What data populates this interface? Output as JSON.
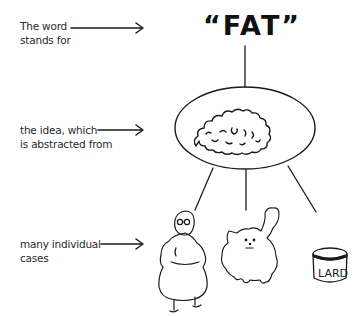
{
  "diagram": {
    "word": "“FAT”",
    "labels": [
      {
        "line1": "The word",
        "line2": "stands for"
      },
      {
        "line1": "the idea, which",
        "line2": "is abstracted from"
      },
      {
        "line1": "many individual",
        "line2": "cases"
      }
    ],
    "idea_illustration": "brain-cloud",
    "cases": [
      {
        "name": "fat-woman"
      },
      {
        "name": "fat-cat"
      },
      {
        "name": "lard-can",
        "text": "LARD"
      }
    ]
  }
}
